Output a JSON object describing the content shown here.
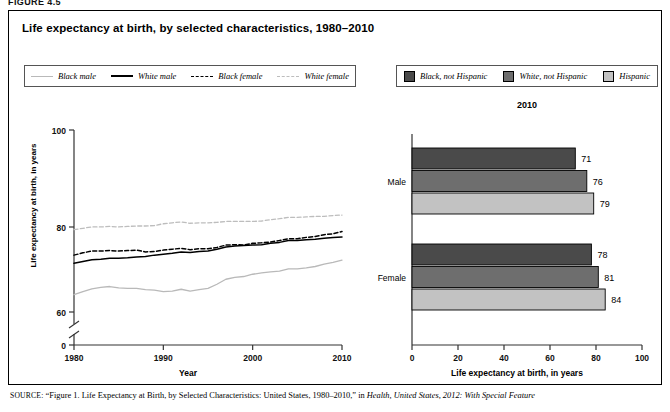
{
  "figure_label": "FIGURE 4.5",
  "title": "Life expectancy at birth, by selected characteristics, 1980–2010",
  "legend_left": {
    "items": [
      {
        "label": "Black male",
        "style": "solid",
        "color": "#b9b9b9",
        "icon": "line-swatch-icon"
      },
      {
        "label": "White male",
        "style": "solid",
        "color": "#000000",
        "icon": "line-swatch-icon"
      },
      {
        "label": "Black female",
        "style": "dashed",
        "color": "#000000",
        "icon": "line-swatch-icon"
      },
      {
        "label": "White female",
        "style": "dashed",
        "color": "#bdbdbd",
        "icon": "line-swatch-icon"
      }
    ]
  },
  "legend_right": {
    "items": [
      {
        "label": "Black, not Hispanic",
        "color": "#4a4a4a",
        "icon": "box-swatch-icon"
      },
      {
        "label": "White, not Hispanic",
        "color": "#6e6e6e",
        "icon": "box-swatch-icon"
      },
      {
        "label": "Hispanic",
        "color": "#c2c2c2",
        "icon": "box-swatch-icon"
      }
    ]
  },
  "source_note": {
    "prefix": "SOURCE:",
    "text_1": "“Figure 1. Life Expectancy at Birth, by Selected Characteristics: United States, 1980–2010,” in ",
    "italic_1": "Health, United States, 2012: With Special Feature"
  },
  "chart_data": [
    {
      "type": "line",
      "title": "",
      "xlabel": "Year",
      "ylabel": "Life expectancy at birth, in years",
      "xlim": [
        1980,
        2010
      ],
      "ylim": [
        60,
        100
      ],
      "yticks": [
        0,
        60,
        80,
        100
      ],
      "xticks": [
        1980,
        1990,
        2000,
        2010
      ],
      "axis_break": true,
      "grid": false,
      "legend_position": "top-left",
      "x": [
        1980,
        1981,
        1982,
        1983,
        1984,
        1985,
        1986,
        1987,
        1988,
        1989,
        1990,
        1991,
        1992,
        1993,
        1994,
        1995,
        1996,
        1997,
        1998,
        1999,
        2000,
        2001,
        2002,
        2003,
        2004,
        2005,
        2006,
        2007,
        2008,
        2009,
        2010
      ],
      "series": [
        {
          "name": "White female",
          "color": "#bdbdbd",
          "style": "dashed",
          "values": [
            78.1,
            78.4,
            78.7,
            78.7,
            78.8,
            78.7,
            78.8,
            78.9,
            78.9,
            79.0,
            79.4,
            79.6,
            79.8,
            79.5,
            79.6,
            79.6,
            79.7,
            79.9,
            79.9,
            79.9,
            79.9,
            80.0,
            80.3,
            80.5,
            80.8,
            80.8,
            80.9,
            81.0,
            81.0,
            81.2,
            81.3
          ]
        },
        {
          "name": "Black female",
          "color": "#000000",
          "style": "dashed",
          "values": [
            72.5,
            73.0,
            73.4,
            73.4,
            73.5,
            73.4,
            73.5,
            73.6,
            73.2,
            73.3,
            73.6,
            73.8,
            74.0,
            73.7,
            73.9,
            73.9,
            74.2,
            74.7,
            74.8,
            74.7,
            75.1,
            75.2,
            75.4,
            75.7,
            76.1,
            76.1,
            76.4,
            76.6,
            77.0,
            77.2,
            77.7
          ]
        },
        {
          "name": "White male",
          "color": "#000000",
          "style": "solid",
          "values": [
            70.7,
            71.1,
            71.5,
            71.6,
            71.8,
            71.8,
            71.9,
            72.1,
            72.2,
            72.5,
            72.7,
            72.9,
            73.2,
            73.1,
            73.3,
            73.4,
            73.8,
            74.3,
            74.5,
            74.6,
            74.7,
            74.8,
            75.1,
            75.3,
            75.7,
            75.7,
            75.9,
            76.0,
            76.2,
            76.4,
            76.5
          ]
        },
        {
          "name": "Black male",
          "color": "#b9b9b9",
          "style": "solid",
          "values": [
            63.8,
            64.5,
            65.1,
            65.4,
            65.6,
            65.3,
            65.2,
            65.2,
            64.9,
            64.8,
            64.5,
            64.6,
            65.0,
            64.6,
            64.9,
            65.2,
            66.1,
            67.2,
            67.6,
            67.8,
            68.3,
            68.6,
            68.8,
            69.0,
            69.5,
            69.5,
            69.7,
            70.0,
            70.5,
            70.9,
            71.4
          ]
        }
      ]
    },
    {
      "type": "bar",
      "orientation": "horizontal",
      "title": "2010",
      "xlabel": "Life expectancy at birth, in years",
      "ylabel": "",
      "xlim": [
        0,
        100
      ],
      "xticks": [
        0,
        20,
        40,
        60,
        80,
        100
      ],
      "categories": [
        "Male",
        "Female"
      ],
      "grid": false,
      "legend_position": "top",
      "series": [
        {
          "name": "Black, not Hispanic",
          "color": "#4a4a4a",
          "values": [
            71,
            78
          ]
        },
        {
          "name": "White, not Hispanic",
          "color": "#6e6e6e",
          "values": [
            76,
            81
          ]
        },
        {
          "name": "Hispanic",
          "color": "#c2c2c2",
          "values": [
            79,
            84
          ]
        }
      ],
      "bar_labels": {
        "Male": [
          71,
          76,
          79
        ],
        "Female": [
          78,
          81,
          84
        ]
      }
    }
  ]
}
